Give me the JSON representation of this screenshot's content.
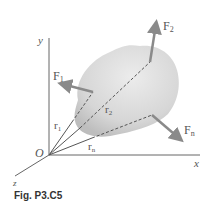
{
  "figure": {
    "caption": "Fig. P3.C5",
    "axes": {
      "x": "x",
      "y": "y",
      "z": "z",
      "origin": "O"
    },
    "forces": [
      {
        "label": "F",
        "sub": "1"
      },
      {
        "label": "F",
        "sub": "2"
      },
      {
        "label": "F",
        "sub": "n"
      }
    ],
    "position_vectors": [
      {
        "label": "r",
        "sub": "1"
      },
      {
        "label": "r",
        "sub": "2"
      },
      {
        "label": "r",
        "sub": "n"
      }
    ],
    "colors": {
      "body_fill": "#d8d8d8",
      "arrow": "#8a8a8a",
      "axis": "#666666",
      "dashed": "#555555"
    }
  }
}
